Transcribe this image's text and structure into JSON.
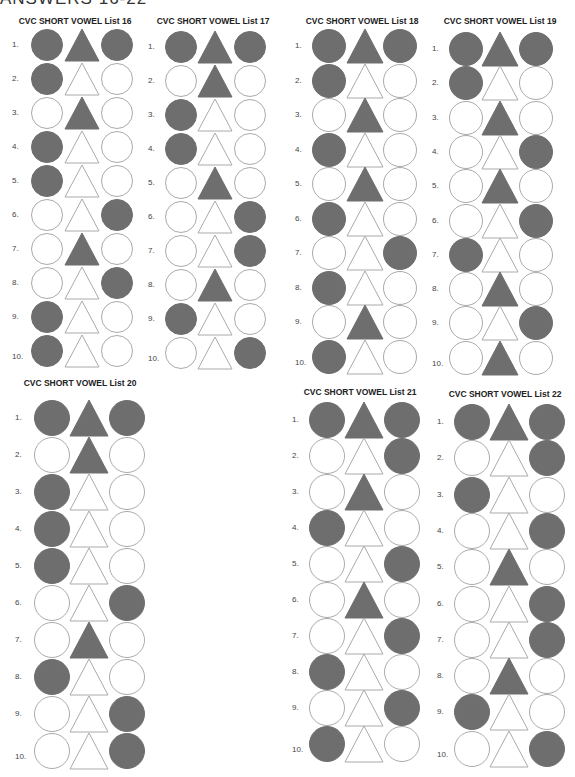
{
  "header": {
    "title": "ANSWERS 16-22"
  },
  "legend": {
    "F": "filled",
    "O": "outline"
  },
  "colors": {
    "filled": "#6e6e6e",
    "outline": "#aaaaaa",
    "background": "#ffffff"
  },
  "lists": [
    {
      "title": "CVC SHORT VOWEL List 16",
      "rows": [
        {
          "n": "1.",
          "shapes": [
            "F",
            "F",
            "F"
          ]
        },
        {
          "n": "2.",
          "shapes": [
            "F",
            "O",
            "O"
          ]
        },
        {
          "n": "3.",
          "shapes": [
            "O",
            "F",
            "O"
          ]
        },
        {
          "n": "4.",
          "shapes": [
            "F",
            "O",
            "O"
          ]
        },
        {
          "n": "5.",
          "shapes": [
            "F",
            "O",
            "O"
          ]
        },
        {
          "n": "6.",
          "shapes": [
            "O",
            "O",
            "F"
          ]
        },
        {
          "n": "7.",
          "shapes": [
            "O",
            "F",
            "O"
          ]
        },
        {
          "n": "8.",
          "shapes": [
            "O",
            "O",
            "F"
          ]
        },
        {
          "n": "9.",
          "shapes": [
            "F",
            "O",
            "O"
          ]
        },
        {
          "n": "10.",
          "shapes": [
            "F",
            "O",
            "O"
          ]
        }
      ]
    },
    {
      "title": "CVC SHORT VOWEL List 17",
      "rows": [
        {
          "n": "1.",
          "shapes": [
            "F",
            "F",
            "F"
          ]
        },
        {
          "n": "2.",
          "shapes": [
            "O",
            "F",
            "O"
          ]
        },
        {
          "n": "3.",
          "shapes": [
            "F",
            "O",
            "O"
          ]
        },
        {
          "n": "4.",
          "shapes": [
            "F",
            "O",
            "O"
          ]
        },
        {
          "n": "5.",
          "shapes": [
            "O",
            "F",
            "O"
          ]
        },
        {
          "n": "6.",
          "shapes": [
            "O",
            "O",
            "F"
          ]
        },
        {
          "n": "7.",
          "shapes": [
            "O",
            "O",
            "F"
          ]
        },
        {
          "n": "8.",
          "shapes": [
            "O",
            "F",
            "O"
          ]
        },
        {
          "n": "9.",
          "shapes": [
            "F",
            "O",
            "O"
          ]
        },
        {
          "n": "10.",
          "shapes": [
            "O",
            "O",
            "F"
          ]
        }
      ]
    },
    {
      "title": "CVC SHORT VOWEL List 18",
      "rows": [
        {
          "n": "1.",
          "shapes": [
            "F",
            "F",
            "F"
          ]
        },
        {
          "n": "2.",
          "shapes": [
            "F",
            "O",
            "O"
          ]
        },
        {
          "n": "3.",
          "shapes": [
            "O",
            "F",
            "O"
          ]
        },
        {
          "n": "4.",
          "shapes": [
            "F",
            "O",
            "O"
          ]
        },
        {
          "n": "5.",
          "shapes": [
            "O",
            "F",
            "O"
          ]
        },
        {
          "n": "6.",
          "shapes": [
            "F",
            "O",
            "O"
          ]
        },
        {
          "n": "7.",
          "shapes": [
            "O",
            "O",
            "F"
          ]
        },
        {
          "n": "8.",
          "shapes": [
            "F",
            "O",
            "O"
          ]
        },
        {
          "n": "9.",
          "shapes": [
            "O",
            "F",
            "O"
          ]
        },
        {
          "n": "10.",
          "shapes": [
            "F",
            "O",
            "O"
          ]
        }
      ]
    },
    {
      "title": "CVC SHORT VOWEL List 19",
      "rows": [
        {
          "n": "1.",
          "shapes": [
            "F",
            "F",
            "F"
          ]
        },
        {
          "n": "2.",
          "shapes": [
            "F",
            "O",
            "O"
          ]
        },
        {
          "n": "3.",
          "shapes": [
            "O",
            "F",
            "O"
          ]
        },
        {
          "n": "4.",
          "shapes": [
            "O",
            "O",
            "F"
          ]
        },
        {
          "n": "5.",
          "shapes": [
            "O",
            "F",
            "O"
          ]
        },
        {
          "n": "6.",
          "shapes": [
            "O",
            "O",
            "F"
          ]
        },
        {
          "n": "7.",
          "shapes": [
            "F",
            "O",
            "O"
          ]
        },
        {
          "n": "8.",
          "shapes": [
            "O",
            "F",
            "O"
          ]
        },
        {
          "n": "9.",
          "shapes": [
            "O",
            "O",
            "F"
          ]
        },
        {
          "n": "10.",
          "shapes": [
            "O",
            "F",
            "O"
          ]
        }
      ]
    },
    {
      "title": "CVC SHORT VOWEL List 20",
      "rows": [
        {
          "n": "1.",
          "shapes": [
            "F",
            "F",
            "F"
          ]
        },
        {
          "n": "2.",
          "shapes": [
            "O",
            "F",
            "O"
          ]
        },
        {
          "n": "3.",
          "shapes": [
            "F",
            "O",
            "O"
          ]
        },
        {
          "n": "4.",
          "shapes": [
            "F",
            "O",
            "O"
          ]
        },
        {
          "n": "5.",
          "shapes": [
            "F",
            "O",
            "O"
          ]
        },
        {
          "n": "6.",
          "shapes": [
            "O",
            "O",
            "F"
          ]
        },
        {
          "n": "7.",
          "shapes": [
            "O",
            "F",
            "O"
          ]
        },
        {
          "n": "8.",
          "shapes": [
            "F",
            "O",
            "O"
          ]
        },
        {
          "n": "9.",
          "shapes": [
            "O",
            "O",
            "F"
          ]
        },
        {
          "n": "10.",
          "shapes": [
            "O",
            "O",
            "F"
          ]
        }
      ]
    },
    {
      "title": "CVC SHORT VOWEL List 21",
      "rows": [
        {
          "n": "1.",
          "shapes": [
            "F",
            "F",
            "F"
          ]
        },
        {
          "n": "2.",
          "shapes": [
            "O",
            "O",
            "F"
          ]
        },
        {
          "n": "3.",
          "shapes": [
            "O",
            "F",
            "O"
          ]
        },
        {
          "n": "4.",
          "shapes": [
            "F",
            "O",
            "O"
          ]
        },
        {
          "n": "5.",
          "shapes": [
            "O",
            "O",
            "F"
          ]
        },
        {
          "n": "6.",
          "shapes": [
            "O",
            "F",
            "O"
          ]
        },
        {
          "n": "7.",
          "shapes": [
            "O",
            "O",
            "F"
          ]
        },
        {
          "n": "8.",
          "shapes": [
            "F",
            "O",
            "O"
          ]
        },
        {
          "n": "9.",
          "shapes": [
            "O",
            "O",
            "F"
          ]
        },
        {
          "n": "10.",
          "shapes": [
            "F",
            "O",
            "O"
          ]
        }
      ]
    },
    {
      "title": "CVC SHORT VOWEL List 22",
      "rows": [
        {
          "n": "1.",
          "shapes": [
            "F",
            "F",
            "F"
          ]
        },
        {
          "n": "2.",
          "shapes": [
            "O",
            "O",
            "F"
          ]
        },
        {
          "n": "3.",
          "shapes": [
            "F",
            "O",
            "O"
          ]
        },
        {
          "n": "4.",
          "shapes": [
            "O",
            "O",
            "F"
          ]
        },
        {
          "n": "5.",
          "shapes": [
            "O",
            "F",
            "O"
          ]
        },
        {
          "n": "6.",
          "shapes": [
            "O",
            "O",
            "F"
          ]
        },
        {
          "n": "7.",
          "shapes": [
            "O",
            "O",
            "F"
          ]
        },
        {
          "n": "8.",
          "shapes": [
            "O",
            "F",
            "O"
          ]
        },
        {
          "n": "9.",
          "shapes": [
            "F",
            "O",
            "O"
          ]
        },
        {
          "n": "10.",
          "shapes": [
            "O",
            "O",
            "F"
          ]
        }
      ]
    }
  ]
}
